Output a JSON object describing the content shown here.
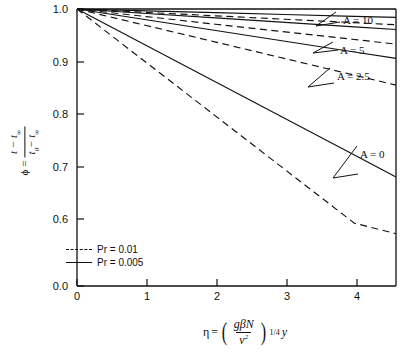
{
  "chart_data": {
    "type": "line",
    "title": "",
    "xlabel": "eta = (g*beta*N/nu^2)^(1/4) * y",
    "ylabel": "phi = (t - t_inf)/(t_0 - t_inf)",
    "xlim": [
      0,
      4.6
    ],
    "ylim": [
      0.0,
      1.0
    ],
    "y_axis_break": true,
    "y_break_between": [
      0.0,
      0.6
    ],
    "grid": false,
    "legend_position": "lower-left-inside",
    "x_ticks": [
      0,
      1,
      2,
      3,
      4
    ],
    "x_tick_labels": [
      "0",
      "1",
      "2",
      "3",
      "4"
    ],
    "y_ticks": [
      0.0,
      0.6,
      0.7,
      0.8,
      0.9,
      1.0
    ],
    "y_tick_labels": [
      "0.0",
      "0.6",
      "0.7",
      "0.8",
      "0.9",
      "1.0"
    ],
    "legend": [
      {
        "label": "Pr = 0.01",
        "style": "dashed"
      },
      {
        "label": "Pr = 0.005",
        "style": "solid"
      }
    ],
    "annotations": [
      {
        "text": "A = 10",
        "x": 4.05,
        "y": 0.983
      },
      {
        "text": "A = 5",
        "x": 4.05,
        "y": 0.955
      },
      {
        "text": "A = 2.5",
        "x": 4.05,
        "y": 0.912
      },
      {
        "text": "A = 0",
        "x": 3.95,
        "y": 0.735
      }
    ],
    "series": [
      {
        "name": "A = 10, Pr = 0.005",
        "A": 10,
        "Pr": 0.005,
        "style": "solid",
        "x": [
          0,
          1,
          2,
          3,
          4,
          4.6
        ],
        "y": [
          1.0,
          0.9965,
          0.993,
          0.9895,
          0.986,
          0.984
        ]
      },
      {
        "name": "A = 10, Pr = 0.01",
        "A": 10,
        "Pr": 0.01,
        "style": "dashed",
        "x": [
          0,
          1,
          2,
          3,
          4,
          4.6
        ],
        "y": [
          1.0,
          0.9935,
          0.987,
          0.9805,
          0.974,
          0.97
        ]
      },
      {
        "name": "A = 5, Pr = 0.005",
        "A": 5,
        "Pr": 0.005,
        "style": "solid",
        "x": [
          0,
          1,
          2,
          3,
          4,
          4.6
        ],
        "y": [
          1.0,
          0.9915,
          0.983,
          0.9745,
          0.966,
          0.961
        ]
      },
      {
        "name": "A = 5, Pr = 0.01",
        "A": 5,
        "Pr": 0.01,
        "style": "dashed",
        "x": [
          0,
          1,
          2,
          3,
          4,
          4.6
        ],
        "y": [
          1.0,
          0.9855,
          0.971,
          0.9565,
          0.942,
          0.933
        ]
      },
      {
        "name": "A = 2.5, Pr = 0.005",
        "A": 2.5,
        "Pr": 0.005,
        "style": "solid",
        "x": [
          0,
          1,
          2,
          3,
          4,
          4.6
        ],
        "y": [
          1.0,
          0.9795,
          0.959,
          0.9385,
          0.918,
          0.906
        ]
      },
      {
        "name": "A = 2.5, Pr = 0.01",
        "A": 2.5,
        "Pr": 0.01,
        "style": "dashed",
        "x": [
          0,
          1,
          2,
          3,
          4,
          4.6
        ],
        "y": [
          1.0,
          0.9685,
          0.937,
          0.9055,
          0.874,
          0.855
        ]
      },
      {
        "name": "A = 0, Pr = 0.005",
        "A": 0,
        "Pr": 0.005,
        "style": "solid",
        "x": [
          0,
          1,
          2,
          3,
          4,
          4.6
        ],
        "y": [
          1.0,
          0.9305,
          0.861,
          0.7915,
          0.722,
          0.68
        ]
      },
      {
        "name": "A = 0, Pr = 0.01",
        "A": 0,
        "Pr": 0.01,
        "style": "dashed",
        "x": [
          0,
          1,
          2,
          3,
          4,
          4.6
        ],
        "y": [
          1.0,
          0.898,
          0.796,
          0.694,
          0.592,
          0.572
        ]
      }
    ]
  },
  "axes": {
    "y_label_parts": {
      "phi": "ϕ",
      "equals": "=",
      "numerator": "t − t",
      "numerator_sub": "∞",
      "denominator": "t",
      "denominator_sub0": "0",
      "denominator_rest": "− t",
      "denominator_sub_inf": "∞"
    },
    "x_label_parts": {
      "eta": "η",
      "equals": "=",
      "numerator": "gβN",
      "denominator": "ν",
      "denominator_sup": "2",
      "exponent": "1/4",
      "variable": "y"
    }
  }
}
